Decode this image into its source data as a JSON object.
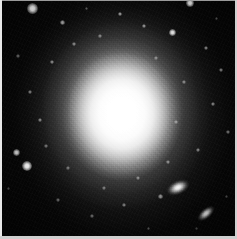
{
  "image": {
    "kind": "astronomical-photograph",
    "subject": "elliptical galaxy with bright saturated core",
    "width": 237,
    "height": 239,
    "background_color": "#040404",
    "core_color": "#ffffff",
    "border_color": "#cfcfcf",
    "alt_text": "Grayscale astronomical image of a bright elliptical galaxy with a saturated white core, a smooth fading halo, scattered foreground stars and two small elongated companion galaxies toward the lower right."
  },
  "galaxy": {
    "center_x": 120,
    "center_y": 110,
    "core_width": 120,
    "core_height": 134,
    "label": "central-elliptical-galaxy"
  },
  "companions": [
    {
      "name": "companion-galaxy-upper",
      "x": 178,
      "y": 187,
      "width": 26,
      "height": 15,
      "rotation": -24,
      "brightness": 1.0
    },
    {
      "name": "companion-galaxy-lower",
      "x": 206,
      "y": 213,
      "width": 22,
      "height": 11,
      "rotation": -40,
      "brightness": 0.92
    }
  ],
  "stars": [
    {
      "x": 32,
      "y": 8,
      "size": 11,
      "brightness": 1.0
    },
    {
      "x": 190,
      "y": 3,
      "size": 8,
      "brightness": 0.95
    },
    {
      "x": 172,
      "y": 32,
      "size": 7,
      "brightness": 0.9
    },
    {
      "x": 27,
      "y": 166,
      "size": 10,
      "brightness": 1.0
    },
    {
      "x": 16,
      "y": 152,
      "size": 7,
      "brightness": 0.82
    },
    {
      "x": 62,
      "y": 22,
      "size": 5,
      "brightness": 0.6
    },
    {
      "x": 120,
      "y": 14,
      "size": 4,
      "brightness": 0.55
    },
    {
      "x": 144,
      "y": 26,
      "size": 4,
      "brightness": 0.5
    },
    {
      "x": 206,
      "y": 48,
      "size": 4,
      "brightness": 0.48
    },
    {
      "x": 221,
      "y": 70,
      "size": 4,
      "brightness": 0.45
    },
    {
      "x": 213,
      "y": 104,
      "size": 4,
      "brightness": 0.46
    },
    {
      "x": 228,
      "y": 132,
      "size": 4,
      "brightness": 0.42
    },
    {
      "x": 198,
      "y": 150,
      "size": 4,
      "brightness": 0.44
    },
    {
      "x": 160,
      "y": 196,
      "size": 5,
      "brightness": 0.52
    },
    {
      "x": 124,
      "y": 205,
      "size": 4,
      "brightness": 0.42
    },
    {
      "x": 92,
      "y": 216,
      "size": 4,
      "brightness": 0.38
    },
    {
      "x": 58,
      "y": 200,
      "size": 4,
      "brightness": 0.36
    },
    {
      "x": 40,
      "y": 120,
      "size": 4,
      "brightness": 0.44
    },
    {
      "x": 30,
      "y": 92,
      "size": 4,
      "brightness": 0.42
    },
    {
      "x": 18,
      "y": 56,
      "size": 4,
      "brightness": 0.38
    },
    {
      "x": 52,
      "y": 62,
      "size": 4,
      "brightness": 0.46
    },
    {
      "x": 74,
      "y": 44,
      "size": 4,
      "brightness": 0.44
    },
    {
      "x": 100,
      "y": 36,
      "size": 4,
      "brightness": 0.42
    },
    {
      "x": 156,
      "y": 58,
      "size": 4,
      "brightness": 0.4
    },
    {
      "x": 184,
      "y": 82,
      "size": 4,
      "brightness": 0.4
    },
    {
      "x": 176,
      "y": 122,
      "size": 4,
      "brightness": 0.4
    },
    {
      "x": 168,
      "y": 162,
      "size": 4,
      "brightness": 0.42
    },
    {
      "x": 138,
      "y": 178,
      "size": 4,
      "brightness": 0.4
    },
    {
      "x": 104,
      "y": 188,
      "size": 4,
      "brightness": 0.38
    },
    {
      "x": 68,
      "y": 168,
      "size": 4,
      "brightness": 0.38
    },
    {
      "x": 46,
      "y": 146,
      "size": 4,
      "brightness": 0.38
    },
    {
      "x": 86,
      "y": 8,
      "size": 3,
      "brightness": 0.34
    },
    {
      "x": 216,
      "y": 18,
      "size": 3,
      "brightness": 0.32
    },
    {
      "x": 8,
      "y": 188,
      "size": 3,
      "brightness": 0.3
    },
    {
      "x": 148,
      "y": 228,
      "size": 3,
      "brightness": 0.3
    },
    {
      "x": 196,
      "y": 228,
      "size": 3,
      "brightness": 0.28
    },
    {
      "x": 226,
      "y": 196,
      "size": 3,
      "brightness": 0.3
    }
  ]
}
